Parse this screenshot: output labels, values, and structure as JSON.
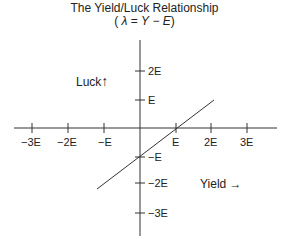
{
  "title": "The Yield/Luck Relationship",
  "subtitle": {
    "open": "(",
    "lambda": "λ",
    "eq": " = ",
    "Y": "Y",
    "minus": " − ",
    "E": "E",
    "close": ")"
  },
  "axes": {
    "y_label": "Luck",
    "y_arrow": "↑",
    "x_label": "Yield",
    "x_arrow": "→"
  },
  "x_ticks": [
    "−3E",
    "−2E",
    "−E",
    "E",
    "2E",
    "3E"
  ],
  "y_ticks": [
    "2E",
    "E",
    "−E",
    "−2E",
    "−3E"
  ],
  "line": {
    "description": "λ = Y − E, slope 1, crosses x-axis at E and y-axis at −E",
    "start": {
      "x": -1.3,
      "y": -2.3
    },
    "end": {
      "x": 2.05,
      "y": 1.0
    }
  },
  "colors": {
    "axis": "#333333",
    "line": "#333333",
    "text": "#222222"
  }
}
